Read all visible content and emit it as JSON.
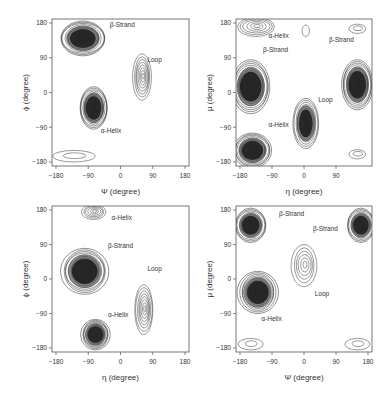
{
  "figure": {
    "layout": "2x2 grid of contour density plots"
  },
  "chart_data": [
    {
      "type": "contour",
      "panel": "top-left",
      "xlabel": "Ψ (degree)",
      "ylabel": "ϕ (degree)",
      "xlim": [
        -180,
        180
      ],
      "ylim": [
        -180,
        180
      ],
      "xticks": [
        "-180",
        "-90",
        "0",
        "90",
        "180"
      ],
      "yticks": [
        "180",
        "90",
        "0",
        "-90",
        "-180"
      ],
      "grid": false,
      "annotations": [
        {
          "text": "β-Strand",
          "x": -30,
          "y": 170
        },
        {
          "text": "Loop",
          "x": 75,
          "y": 80
        },
        {
          "text": "α-Helix",
          "x": -55,
          "y": -105
        }
      ],
      "density_peaks": [
        {
          "name": "β-Strand",
          "x": -105,
          "y": 140,
          "rx": 65,
          "ry": 45,
          "levels": 14
        },
        {
          "name": "α-Helix",
          "x": -75,
          "y": -40,
          "rx": 40,
          "ry": 55,
          "levels": 14
        },
        {
          "name": "Loop",
          "x": 60,
          "y": 40,
          "rx": 25,
          "ry": 60,
          "levels": 8
        },
        {
          "name": "minor",
          "x": -130,
          "y": -165,
          "rx": 60,
          "ry": 15,
          "levels": 2
        }
      ]
    },
    {
      "type": "contour",
      "panel": "top-right",
      "xlabel": "η (degree)",
      "ylabel": "μ (degree)",
      "xlim": [
        -180,
        180
      ],
      "ylim": [
        -180,
        180
      ],
      "xticks": [
        "-180",
        "-90",
        "0",
        "90"
      ],
      "yticks": [
        "180",
        "90",
        "0",
        "-90",
        "-180"
      ],
      "grid": false,
      "annotations": [
        {
          "text": "α-Helix",
          "x": -100,
          "y": 140
        },
        {
          "text": "β-Strand",
          "x": -115,
          "y": 105
        },
        {
          "text": "β-Strand",
          "x": 70,
          "y": 130
        },
        {
          "text": "Loop",
          "x": 40,
          "y": -25
        },
        {
          "text": "α-Helix",
          "x": -100,
          "y": -90
        }
      ],
      "density_peaks": [
        {
          "name": "β-Strand-left",
          "x": -150,
          "y": 15,
          "rx": 55,
          "ry": 70,
          "levels": 14
        },
        {
          "name": "α-Helix-bottom",
          "x": -145,
          "y": -150,
          "rx": 55,
          "ry": 45,
          "levels": 14
        },
        {
          "name": "α-Helix-top",
          "x": -135,
          "y": 170,
          "rx": 55,
          "ry": 25,
          "levels": 6
        },
        {
          "name": "Loop",
          "x": 5,
          "y": -80,
          "rx": 35,
          "ry": 65,
          "levels": 12
        },
        {
          "name": "β-Strand-right",
          "x": 150,
          "y": 20,
          "rx": 45,
          "ry": 65,
          "levels": 14
        },
        {
          "name": "minor-top",
          "x": 150,
          "y": 165,
          "rx": 25,
          "ry": 12,
          "levels": 2
        },
        {
          "name": "minor-top-mid",
          "x": 5,
          "y": 160,
          "rx": 10,
          "ry": 15,
          "levels": 1
        },
        {
          "name": "minor-bottom-right",
          "x": 150,
          "y": -160,
          "rx": 25,
          "ry": 12,
          "levels": 2
        }
      ]
    },
    {
      "type": "contour",
      "panel": "bottom-left",
      "xlabel": "η (degree)",
      "ylabel": "ϕ (degree)",
      "xlim": [
        -180,
        180
      ],
      "ylim": [
        -180,
        180
      ],
      "xticks": [
        "-180",
        "-90",
        "0",
        "90",
        "180"
      ],
      "yticks": [
        "180",
        "90",
        "0",
        "-90",
        "-180"
      ],
      "grid": false,
      "annotations": [
        {
          "text": "α-Helix",
          "x": -25,
          "y": 155
        },
        {
          "text": "β-Strand",
          "x": -35,
          "y": 80
        },
        {
          "text": "Loop",
          "x": 75,
          "y": 20
        },
        {
          "text": "α-Helix",
          "x": -35,
          "y": -100
        }
      ],
      "density_peaks": [
        {
          "name": "α-Helix-top",
          "x": -75,
          "y": 175,
          "rx": 35,
          "ry": 20,
          "levels": 6
        },
        {
          "name": "β-Strand",
          "x": -100,
          "y": 20,
          "rx": 65,
          "ry": 60,
          "levels": 14
        },
        {
          "name": "α-Helix-bottom",
          "x": -70,
          "y": -145,
          "rx": 40,
          "ry": 40,
          "levels": 14
        },
        {
          "name": "Loop",
          "x": 65,
          "y": -80,
          "rx": 25,
          "ry": 65,
          "levels": 8
        }
      ]
    },
    {
      "type": "contour",
      "panel": "bottom-right",
      "xlabel": "Ψ (degree)",
      "ylabel": "μ (degree)",
      "xlim": [
        -180,
        180
      ],
      "ylim": [
        -180,
        180
      ],
      "xticks": [
        "-180",
        "-90",
        "0",
        "90",
        "180"
      ],
      "yticks": [
        "180",
        "90",
        "0",
        "-90",
        "-180"
      ],
      "grid": false,
      "annotations": [
        {
          "text": "β-Strand",
          "x": -70,
          "y": 165
        },
        {
          "text": "β-Strand",
          "x": 25,
          "y": 125
        },
        {
          "text": "Loop",
          "x": 30,
          "y": -45
        },
        {
          "text": "α-Helix",
          "x": -120,
          "y": -110
        }
      ],
      "density_peaks": [
        {
          "name": "β-Strand-left",
          "x": -150,
          "y": 140,
          "rx": 45,
          "ry": 45,
          "levels": 12
        },
        {
          "name": "α-Helix",
          "x": -130,
          "y": -35,
          "rx": 55,
          "ry": 55,
          "levels": 14
        },
        {
          "name": "Loop",
          "x": 0,
          "y": 35,
          "rx": 35,
          "ry": 55,
          "levels": 6
        },
        {
          "name": "β-Strand-right",
          "x": 160,
          "y": 140,
          "rx": 40,
          "ry": 45,
          "levels": 12
        },
        {
          "name": "minor-bottom-left",
          "x": -150,
          "y": -170,
          "rx": 35,
          "ry": 15,
          "levels": 2
        },
        {
          "name": "minor-bottom-right",
          "x": 150,
          "y": -170,
          "rx": 35,
          "ry": 15,
          "levels": 2
        }
      ]
    }
  ]
}
